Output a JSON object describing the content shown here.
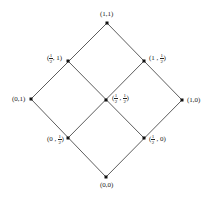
{
  "diagram": {
    "type": "lattice",
    "line_color": "#333333",
    "node_color": "#111111",
    "nodes": [
      {
        "id": "n11",
        "x": 107,
        "y": 23,
        "label": "(1,1)"
      },
      {
        "id": "nh1",
        "x": 68,
        "y": 61,
        "label_pre": "(",
        "frac_n": "1",
        "frac_d": "2",
        "label_post": ", 1)"
      },
      {
        "id": "n1h",
        "x": 144,
        "y": 61,
        "label_pre": "(1 , ",
        "frac_n": "1",
        "frac_d": "2",
        "label_post": ")"
      },
      {
        "id": "n01",
        "x": 31,
        "y": 99,
        "label": "(0,1)"
      },
      {
        "id": "nhh",
        "x": 106,
        "y": 100,
        "label_pre": "(",
        "frac_n": "1",
        "frac_d": "2",
        "label_mid": " , ",
        "frac2_n": "1",
        "frac2_d": "2",
        "label_post": ")"
      },
      {
        "id": "n10",
        "x": 182,
        "y": 100,
        "label": "(1,0)"
      },
      {
        "id": "n0h",
        "x": 68,
        "y": 138,
        "label_pre": "(0 , ",
        "frac_n": "1",
        "frac_d": "2",
        "label_post": ")"
      },
      {
        "id": "nh0",
        "x": 144,
        "y": 138,
        "label_pre": "(",
        "frac_n": "1",
        "frac_d": "2",
        "label_post": " , 0)"
      },
      {
        "id": "n00",
        "x": 106,
        "y": 177,
        "label": "(0,0)"
      }
    ],
    "edges": [
      [
        "n11",
        "nh1"
      ],
      [
        "nh1",
        "n01"
      ],
      [
        "n11",
        "n1h"
      ],
      [
        "n1h",
        "n10"
      ],
      [
        "nh1",
        "nhh"
      ],
      [
        "nhh",
        "nh0"
      ],
      [
        "n1h",
        "nhh"
      ],
      [
        "nhh",
        "n0h"
      ],
      [
        "n01",
        "n0h"
      ],
      [
        "n0h",
        "n00"
      ],
      [
        "n10",
        "nh0"
      ],
      [
        "nh0",
        "n00"
      ]
    ]
  }
}
